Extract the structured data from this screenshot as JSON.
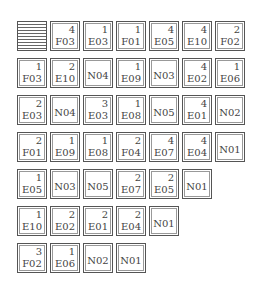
{
  "grid": {
    "rows": [
      [
        {
          "striped": true
        },
        {
          "num": "4",
          "code": "F03"
        },
        {
          "num": "1",
          "code": "E03"
        },
        {
          "num": "1",
          "code": "F01"
        },
        {
          "num": "4",
          "code": "E05"
        },
        {
          "num": "4",
          "code": "E10"
        },
        {
          "num": "2",
          "code": "F02"
        }
      ],
      [
        {
          "num": "1",
          "code": "F03"
        },
        {
          "num": "2",
          "code": "E10"
        },
        {
          "num": "",
          "code": "N04"
        },
        {
          "num": "1",
          "code": "E09"
        },
        {
          "num": "",
          "code": "N03"
        },
        {
          "num": "4",
          "code": "E02"
        },
        {
          "num": "1",
          "code": "E06"
        }
      ],
      [
        {
          "num": "2",
          "code": "E03"
        },
        {
          "num": "",
          "code": "N04"
        },
        {
          "num": "3",
          "code": "E03"
        },
        {
          "num": "1",
          "code": "E08"
        },
        {
          "num": "",
          "code": "N05"
        },
        {
          "num": "4",
          "code": "E01"
        },
        {
          "num": "",
          "code": "N02"
        }
      ],
      [
        {
          "num": "2",
          "code": "F01"
        },
        {
          "num": "1",
          "code": "E09"
        },
        {
          "num": "1",
          "code": "E08"
        },
        {
          "num": "2",
          "code": "F04"
        },
        {
          "num": "4",
          "code": "E07"
        },
        {
          "num": "4",
          "code": "E04"
        },
        {
          "num": "",
          "code": "N01"
        }
      ],
      [
        {
          "num": "1",
          "code": "E05"
        },
        {
          "num": "",
          "code": "N03"
        },
        {
          "num": "",
          "code": "N05"
        },
        {
          "num": "2",
          "code": "E07"
        },
        {
          "num": "2",
          "code": "E05"
        },
        {
          "num": "",
          "code": "N01"
        }
      ],
      [
        {
          "num": "1",
          "code": "E10"
        },
        {
          "num": "2",
          "code": "E02"
        },
        {
          "num": "2",
          "code": "E01"
        },
        {
          "num": "2",
          "code": "E04"
        },
        {
          "num": "",
          "code": "N01"
        }
      ],
      [
        {
          "num": "3",
          "code": "F02"
        },
        {
          "num": "1",
          "code": "E06"
        },
        {
          "num": "",
          "code": "N02"
        },
        {
          "num": "",
          "code": "N01"
        }
      ]
    ]
  },
  "colors": {
    "border": "#555555",
    "text": "#444444",
    "background": "#ffffff"
  }
}
